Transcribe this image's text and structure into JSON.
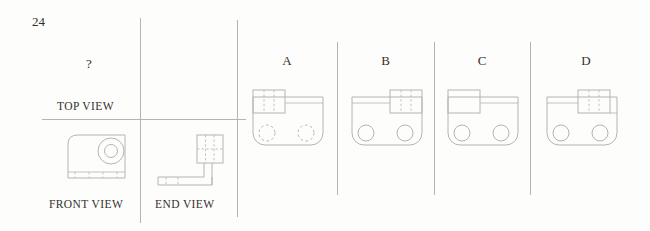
{
  "colors": {
    "line": "#b8b3af",
    "text": "#35302d",
    "background": "#fdfdfc"
  },
  "question": {
    "number": "24",
    "unknown_mark": "?",
    "top_view_label": "TOP VIEW",
    "front_view_label": "FRONT VIEW",
    "end_view_label": "END VIEW"
  },
  "options": [
    {
      "label": "A",
      "block_side": "left",
      "block_hidden_lines": true,
      "holes_style": "dashed"
    },
    {
      "label": "B",
      "block_side": "right",
      "block_hidden_lines": true,
      "holes_style": "solid"
    },
    {
      "label": "C",
      "block_side": "left",
      "block_hidden_lines": false,
      "holes_style": "solid"
    },
    {
      "label": "D",
      "block_side": "right-inset",
      "block_hidden_lines": true,
      "holes_style": "solid"
    }
  ]
}
